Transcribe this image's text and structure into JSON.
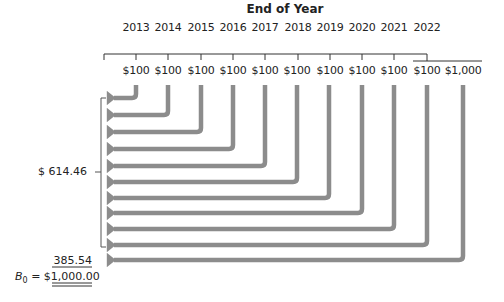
{
  "diagram": {
    "title": "End of Year",
    "years": [
      "2013",
      "2014",
      "2015",
      "2016",
      "2017",
      "2018",
      "2019",
      "2020",
      "2021",
      "2022"
    ],
    "cash_flows": [
      "$100",
      "$100",
      "$100",
      "$100",
      "$100",
      "$100",
      "$100",
      "$100",
      "$100",
      "$100",
      "$1,000"
    ],
    "coupon_pv_total_label": "$  614.46",
    "principal_pv_label": "385.54",
    "bond_value_label": "B",
    "bond_value_subscript": "0",
    "bond_value_equals": "=",
    "bond_value_total": "$1,000.00",
    "colors": {
      "arrow": "#8c8c8c",
      "line": "#333333",
      "text": "#222222"
    }
  }
}
